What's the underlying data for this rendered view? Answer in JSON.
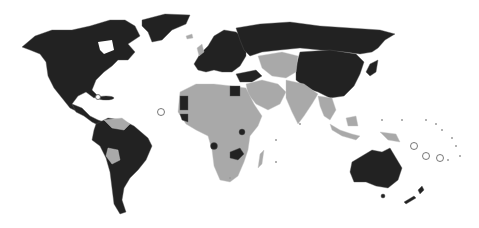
{
  "map": {
    "type": "world-choropleth",
    "projection": "robinson-like",
    "legend": null,
    "colors": {
      "background": "#ffffff",
      "category_a": "#222222",
      "category_b": "#a9a9a9",
      "border": "#555555"
    },
    "regions": [
      {
        "name": "north-america",
        "category": "a"
      },
      {
        "name": "greenland",
        "category": "a"
      },
      {
        "name": "central-america-mexico",
        "category": "a"
      },
      {
        "name": "caribbean",
        "category": "a"
      },
      {
        "name": "south-america",
        "category": "a"
      },
      {
        "name": "venezuela-guyana",
        "category": "b"
      },
      {
        "name": "bolivia",
        "category": "b"
      },
      {
        "name": "europe",
        "category": "a"
      },
      {
        "name": "iceland-uk",
        "category": "b"
      },
      {
        "name": "russia",
        "category": "a"
      },
      {
        "name": "china-mongolia",
        "category": "a"
      },
      {
        "name": "japan-korea",
        "category": "a"
      },
      {
        "name": "central-asia-middle-east",
        "category": "b"
      },
      {
        "name": "turkey-caucasus",
        "category": "a"
      },
      {
        "name": "south-asia",
        "category": "b"
      },
      {
        "name": "southeast-asia",
        "category": "b"
      },
      {
        "name": "africa",
        "category": "b"
      },
      {
        "name": "western-sahara-mauritania",
        "category": "a"
      },
      {
        "name": "egypt",
        "category": "a"
      },
      {
        "name": "senegal",
        "category": "a"
      },
      {
        "name": "gabon-cameroon",
        "category": "a"
      },
      {
        "name": "uganda",
        "category": "a"
      },
      {
        "name": "zambia-malawi",
        "category": "a"
      },
      {
        "name": "madagascar",
        "category": "b"
      },
      {
        "name": "australia",
        "category": "a"
      },
      {
        "name": "new-zealand",
        "category": "a"
      },
      {
        "name": "pacific-islands",
        "category": "b"
      }
    ]
  }
}
